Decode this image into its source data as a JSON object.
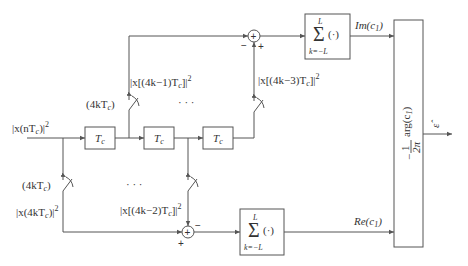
{
  "diagram": {
    "input_label": "|x(nT",
    "input_label_sub": "c",
    "input_label_tail": ")|",
    "input_label_sup": "2",
    "delay_blocks": [
      {
        "label": "T",
        "sub": "c"
      },
      {
        "label": "T",
        "sub": "c"
      },
      {
        "label": "T",
        "sub": "c"
      }
    ],
    "ellipsis": "· · ·",
    "switch_labels": {
      "top_left": "(4kT",
      "bottom_left": "(4kT",
      "sub": "c",
      "close": ")"
    },
    "tap_labels": {
      "top_left": "|x[(4k−1)T",
      "top_right": "|x[(4k−3)T",
      "bottom_left": "|x(4kT",
      "bottom_right": "|x[(4k−2)T",
      "sub": "c",
      "tail_bracket": "]|",
      "tail_paren": ")|",
      "sup": "2"
    },
    "summing_junctions": [
      {
        "name": "top",
        "minus": "−",
        "plus": "+"
      },
      {
        "name": "bottom",
        "minus": "−",
        "plus": "+"
      }
    ],
    "sum_blocks": [
      {
        "symbol": "Σ",
        "upper": "L",
        "lower": "k=−L",
        "arg": "(·)"
      },
      {
        "symbol": "Σ",
        "upper": "L",
        "lower": "k=−L",
        "arg": "(·)"
      }
    ],
    "outputs": {
      "imag": "Im(c",
      "real": "Re(c",
      "sub": "1",
      "close": ")"
    },
    "arg_block": {
      "minus": "−",
      "numerator": "1",
      "denominator": "2π",
      "func": "arg(c",
      "sub": "1",
      "close": ")"
    },
    "final_output": "ε̂"
  }
}
